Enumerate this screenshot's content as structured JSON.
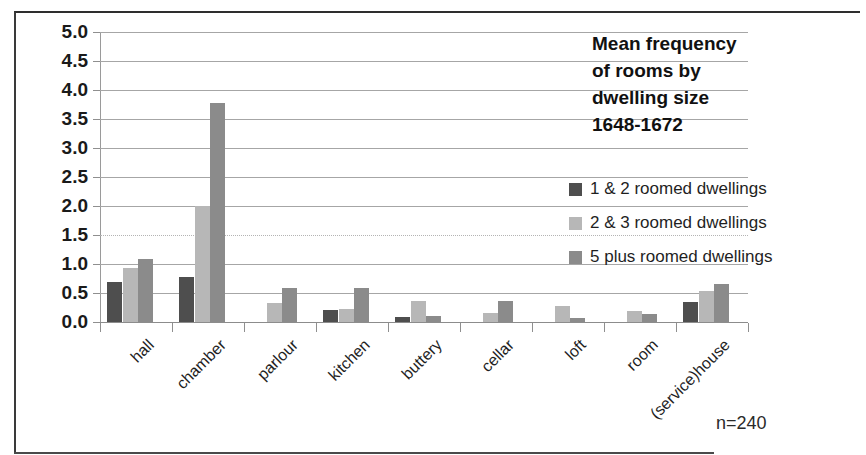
{
  "figure": {
    "title_lines": [
      "Mean frequency",
      "of rooms by",
      "dwelling size",
      "1648-1672"
    ],
    "sample_note": "n=240"
  },
  "colors": {
    "series_1": "#4e4e4e",
    "series_2": "#b7b7b7",
    "series_3": "#8b8b8b",
    "gridline": "#a6a6a6",
    "axis": "#8c8c8c",
    "text": "#1f1f1f",
    "background": "#ffffff"
  },
  "chart_data": {
    "type": "bar",
    "xlabel": "",
    "ylabel": "",
    "ylim": [
      0.0,
      5.0
    ],
    "ytick_labels": [
      "0.0",
      "0.5",
      "1.0",
      "1.5",
      "2.0",
      "2.5",
      "3.0",
      "3.5",
      "4.0",
      "4.5",
      "5.0"
    ],
    "ytick_values": [
      0.0,
      0.5,
      1.0,
      1.5,
      2.0,
      2.5,
      3.0,
      3.5,
      4.0,
      4.5,
      5.0
    ],
    "grid": true,
    "legend_position": "right",
    "annotation": "n=240",
    "categories": [
      "hall",
      "chamber",
      "parlour",
      "kitchen",
      "buttery",
      "cellar",
      "loft",
      "room",
      "(service)house"
    ],
    "series": [
      {
        "name": "1 & 2 roomed dwellings",
        "color": "#4e4e4e",
        "values": [
          0.69,
          0.78,
          0.0,
          0.2,
          0.08,
          0.0,
          0.0,
          0.0,
          0.35
        ]
      },
      {
        "name": "2 & 3 roomed dwellings",
        "color": "#b7b7b7",
        "values": [
          0.93,
          2.0,
          0.33,
          0.22,
          0.37,
          0.15,
          0.27,
          0.19,
          0.53
        ]
      },
      {
        "name": "5 plus roomed dwellings",
        "color": "#8b8b8b",
        "values": [
          1.08,
          3.78,
          0.58,
          0.58,
          0.1,
          0.37,
          0.07,
          0.13,
          0.65
        ]
      }
    ]
  }
}
